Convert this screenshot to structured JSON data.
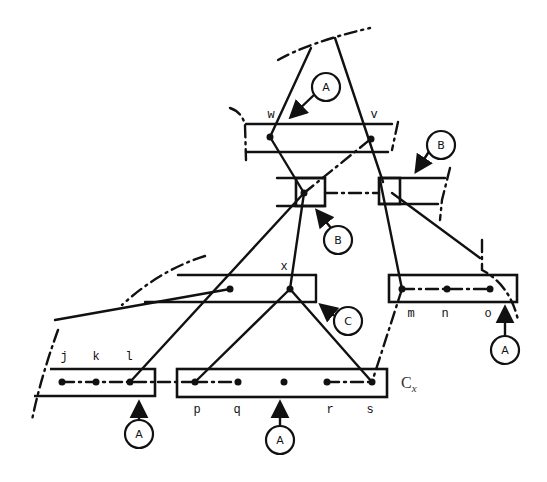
{
  "diagram": {
    "node_labels": {
      "w": "w",
      "v": "v",
      "x": "x",
      "j": "j",
      "k": "k",
      "l": "l",
      "m": "m",
      "n": "n",
      "o": "o",
      "p": "p",
      "q": "q",
      "r": "r",
      "s": "s"
    },
    "cluster_label": "C",
    "cluster_subscript": "x",
    "callouts": [
      {
        "id": "a1",
        "label": "A"
      },
      {
        "id": "b1",
        "label": "B"
      },
      {
        "id": "b2",
        "label": "B"
      },
      {
        "id": "c1",
        "label": "C"
      },
      {
        "id": "a2",
        "label": "A"
      },
      {
        "id": "a3",
        "label": "A"
      },
      {
        "id": "a4",
        "label": "A"
      }
    ]
  }
}
